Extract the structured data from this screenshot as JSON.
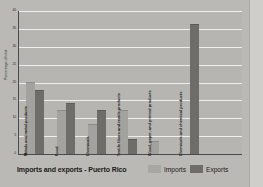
{
  "chart_data": {
    "type": "bar",
    "title": "Imports and exports - Puerto Rico",
    "xlabel": "",
    "ylabel": "Percentage of total",
    "ylim": [
      0,
      40
    ],
    "yticks": [
      "0",
      "5",
      "10",
      "15",
      "20",
      "25",
      "30",
      "35",
      "40"
    ],
    "grid": true,
    "legend_position": "bottom-right",
    "orientation": "vertical",
    "categories": [
      "Metals and metal products",
      "Food",
      "Chemicals",
      "Textile fibers and textile products",
      "Wood, paper, and printed products",
      "Chemicals and chemical products"
    ],
    "series": [
      {
        "name": "Imports",
        "color": "#a8a7a3",
        "values": [
          20,
          12,
          8,
          12,
          3.5,
          0
        ]
      },
      {
        "name": "Exports",
        "color": "#6e6d6a",
        "values": [
          17.5,
          14,
          12,
          4,
          0,
          36
        ]
      }
    ]
  },
  "legend": {
    "imports_label": "Imports",
    "exports_label": "Exports"
  }
}
